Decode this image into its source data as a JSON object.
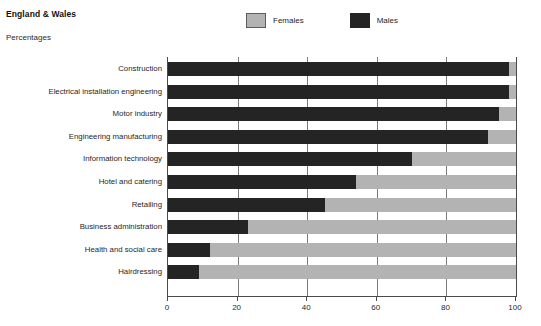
{
  "header": {
    "region_title": "England & Wales",
    "units_label": "Percentages"
  },
  "legend": {
    "entries": [
      {
        "label": "Females",
        "color": "#b3b3b3",
        "swatch_name": "legend-swatch-females"
      },
      {
        "label": "Males",
        "color": "#242424",
        "swatch_name": "legend-swatch-males"
      }
    ]
  },
  "chart_data": {
    "type": "bar",
    "orientation": "horizontal",
    "stacked": true,
    "title": "England & Wales",
    "subtitle": "Percentages",
    "xlabel": "",
    "ylabel": "",
    "xlim": [
      0,
      100
    ],
    "xticks": [
      0,
      20,
      40,
      60,
      80,
      100
    ],
    "xticklabels": [
      "0",
      "20",
      "40",
      "60",
      "80",
      "100"
    ],
    "grid": true,
    "legend_position": "top",
    "categories": [
      "Construction",
      "Electrical installation engineering",
      "Motor industry",
      "Engineering manufacturing",
      "Information technology",
      "Hotel and catering",
      "Retailing",
      "Business administration",
      "Health and social care",
      "Hairdressing"
    ],
    "series": [
      {
        "name": "Males",
        "color": "#242424",
        "values": [
          98,
          98,
          95,
          92,
          70,
          54,
          45,
          23,
          12,
          9
        ]
      },
      {
        "name": "Females",
        "color": "#b3b3b3",
        "values": [
          2,
          2,
          5,
          8,
          30,
          46,
          55,
          77,
          88,
          91
        ]
      }
    ]
  }
}
